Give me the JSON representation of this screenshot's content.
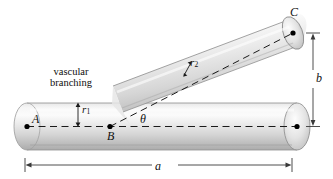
{
  "figure": {
    "kind": "vascular-branching-diagram",
    "background_color": "#ffffff",
    "caption": {
      "line1": "vascular",
      "line2": "branching"
    },
    "points": {
      "A": "A",
      "B": "B",
      "C": "C"
    },
    "dimensions": {
      "horizontal_span": "a",
      "vertical_span": "b"
    },
    "radii": {
      "main_vessel": "r",
      "main_vessel_subscript": "1",
      "branch_vessel": "r",
      "branch_vessel_subscript": "2"
    },
    "angle": {
      "symbol": "θ"
    },
    "colors": {
      "cylinder_light": "#f3f3f3",
      "cylinder_mid": "#d8d8d8",
      "cylinder_dark": "#a9a9a9",
      "outline": "#6f6f6f",
      "axis_dash": "#1a1a1a",
      "dimension_line": "#3a3a3a",
      "label_text": "#111111"
    }
  }
}
